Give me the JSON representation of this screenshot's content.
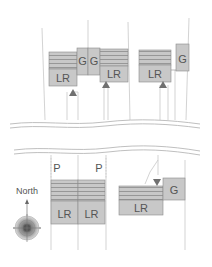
{
  "colors": {
    "building_fill": "#c8c8c8",
    "building_stroke": "#8a8a8a",
    "stripe": "#8a8a8a",
    "entry_marker": "#707070",
    "lot_line": "#c8c8c8",
    "road_line": "#b8b8b8",
    "text": "#555555"
  },
  "labels": {
    "living_room": "LR",
    "garage": "G",
    "parking": "P",
    "north": "North"
  },
  "north_block": {
    "houses": [
      {
        "id": "house-1",
        "lr_label": "LR"
      },
      {
        "id": "house-2",
        "lr_label": "LR"
      },
      {
        "id": "house-3",
        "lr_label": "LR"
      }
    ],
    "garages": [
      "G",
      "G",
      "G"
    ]
  },
  "south_block": {
    "houses": [
      {
        "id": "house-4",
        "lr_label": "LR",
        "parking_label": "P"
      },
      {
        "id": "house-5",
        "lr_label": "LR",
        "parking_label": "P"
      },
      {
        "id": "house-6",
        "lr_label": "LR",
        "garage_label": "G"
      }
    ]
  },
  "compass": {
    "label": "North"
  }
}
